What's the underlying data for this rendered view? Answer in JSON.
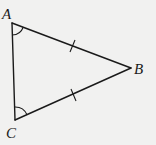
{
  "diagram": {
    "type": "isosceles-triangle",
    "background_color": "#f1f1f0",
    "stroke_color": "#1a1a1a",
    "vertices": {
      "A": {
        "label": "A",
        "x": 12,
        "y": 23
      },
      "B": {
        "label": "B",
        "x": 131,
        "y": 68
      },
      "C": {
        "label": "C",
        "x": 15,
        "y": 120
      }
    },
    "edges": [
      {
        "from": "A",
        "to": "B",
        "tick_marks": 1
      },
      {
        "from": "C",
        "to": "B",
        "tick_marks": 1
      },
      {
        "from": "A",
        "to": "C",
        "tick_marks": 0
      }
    ],
    "angle_marks": [
      {
        "vertex": "A",
        "arcs": 1
      },
      {
        "vertex": "C",
        "arcs": 1
      }
    ]
  }
}
